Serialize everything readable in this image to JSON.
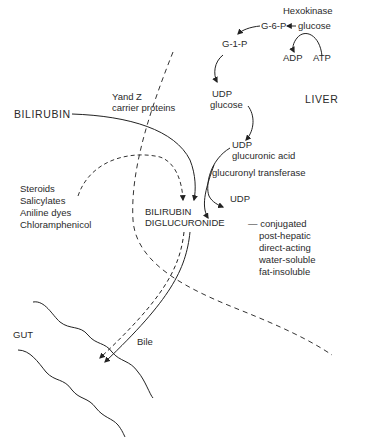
{
  "diagram": {
    "type": "metabolic-pathway",
    "regions": {
      "liver": "LIVER",
      "gut": "GUT"
    },
    "top_pathway": {
      "enzyme": "Hexokinase",
      "glucose": "glucose",
      "g6p": "G-6-P",
      "g1p": "G-1-P",
      "adp": "ADP",
      "atp": "ATP",
      "udp_glucose_1": "UDP",
      "udp_glucose_2": "glucose",
      "udp_glucuronic_1": "UDP",
      "udp_glucuronic_2": "glucuronic acid",
      "transferase": "glucuronyl transferase",
      "udp_out": "UDP"
    },
    "bilirubin": "BILIRUBIN",
    "carriers_1": "Yand Z",
    "carriers_2": "carrier proteins",
    "inhibitors": [
      "Steroids",
      "Salicylates",
      "Aniline dyes",
      "Chloramphenicol"
    ],
    "product_1": "BILIRUBIN",
    "product_2": "DIGLUCURONIDE",
    "properties": [
      "— conjugated",
      "post-hepatic",
      "direct-acting",
      "water-soluble",
      "fat-insoluble"
    ],
    "bile": "Bile"
  }
}
